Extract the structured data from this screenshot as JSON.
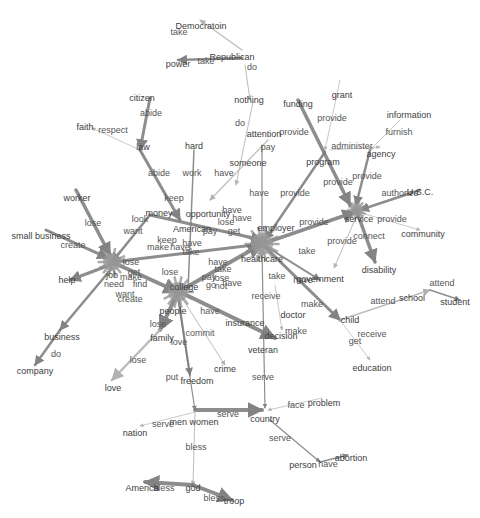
{
  "diagram": {
    "type": "semantic-network",
    "colors": {
      "edge": "#7a7a7a",
      "edge_light": "#b5b5b5",
      "hub": "#9a9a9a",
      "text": "#444444",
      "background": "#ffffff"
    },
    "hubs": [
      {
        "id": "hub-left",
        "x": 112,
        "y": 262,
        "r": 9
      },
      {
        "id": "hub-center",
        "x": 178,
        "y": 292,
        "r": 10
      },
      {
        "id": "hub-right",
        "x": 262,
        "y": 244,
        "r": 11
      },
      {
        "id": "hub-service",
        "x": 357,
        "y": 210,
        "r": 6
      }
    ],
    "edges": [
      {
        "x1": 242,
        "y1": 50,
        "x2": 200,
        "y2": 20,
        "w": 1.2,
        "c": "light"
      },
      {
        "x1": 242,
        "y1": 58,
        "x2": 178,
        "y2": 60,
        "w": 2.5,
        "c": "dark"
      },
      {
        "x1": 245,
        "y1": 65,
        "x2": 250,
        "y2": 100,
        "w": 1,
        "c": "light"
      },
      {
        "x1": 253,
        "y1": 102,
        "x2": 236,
        "y2": 185,
        "w": 1,
        "c": "light"
      },
      {
        "x1": 150,
        "y1": 98,
        "x2": 140,
        "y2": 150,
        "w": 3,
        "c": "dark"
      },
      {
        "x1": 140,
        "y1": 150,
        "x2": 92,
        "y2": 128,
        "w": 0.8,
        "c": "light"
      },
      {
        "x1": 140,
        "y1": 150,
        "x2": 180,
        "y2": 220,
        "w": 3,
        "c": "dark"
      },
      {
        "x1": 194,
        "y1": 150,
        "x2": 188,
        "y2": 290,
        "w": 1.5,
        "c": "dark"
      },
      {
        "x1": 268,
        "y1": 140,
        "x2": 210,
        "y2": 200,
        "w": 1.2,
        "c": "light"
      },
      {
        "x1": 262,
        "y1": 145,
        "x2": 262,
        "y2": 240,
        "w": 1.2,
        "c": "dark"
      },
      {
        "x1": 298,
        "y1": 100,
        "x2": 350,
        "y2": 205,
        "w": 3.5,
        "c": "dark"
      },
      {
        "x1": 340,
        "y1": 80,
        "x2": 325,
        "y2": 150,
        "w": 0.8,
        "c": "light"
      },
      {
        "x1": 325,
        "y1": 152,
        "x2": 265,
        "y2": 240,
        "w": 2.5,
        "c": "dark"
      },
      {
        "x1": 330,
        "y1": 150,
        "x2": 380,
        "y2": 147,
        "w": 0.8,
        "c": "light"
      },
      {
        "x1": 370,
        "y1": 150,
        "x2": 356,
        "y2": 205,
        "w": 2.5,
        "c": "dark"
      },
      {
        "x1": 400,
        "y1": 120,
        "x2": 370,
        "y2": 150,
        "w": 0.8,
        "c": "light"
      },
      {
        "x1": 420,
        "y1": 190,
        "x2": 360,
        "y2": 210,
        "w": 2.5,
        "c": "dark"
      },
      {
        "x1": 358,
        "y1": 212,
        "x2": 420,
        "y2": 230,
        "w": 0.8,
        "c": "light"
      },
      {
        "x1": 357,
        "y1": 212,
        "x2": 375,
        "y2": 262,
        "w": 3.5,
        "c": "dark"
      },
      {
        "x1": 262,
        "y1": 244,
        "x2": 355,
        "y2": 212,
        "w": 3.5,
        "c": "dark"
      },
      {
        "x1": 357,
        "y1": 215,
        "x2": 334,
        "y2": 268,
        "w": 1,
        "c": "light"
      },
      {
        "x1": 76,
        "y1": 190,
        "x2": 110,
        "y2": 255,
        "w": 3.5,
        "c": "dark"
      },
      {
        "x1": 46,
        "y1": 230,
        "x2": 108,
        "y2": 258,
        "w": 3,
        "c": "dark"
      },
      {
        "x1": 110,
        "y1": 265,
        "x2": 70,
        "y2": 280,
        "w": 3,
        "c": "dark"
      },
      {
        "x1": 112,
        "y1": 268,
        "x2": 60,
        "y2": 330,
        "w": 2.5,
        "c": "dark"
      },
      {
        "x1": 60,
        "y1": 330,
        "x2": 35,
        "y2": 365,
        "w": 2.5,
        "c": "dark"
      },
      {
        "x1": 112,
        "y1": 262,
        "x2": 178,
        "y2": 292,
        "w": 4,
        "c": "dark"
      },
      {
        "x1": 112,
        "y1": 262,
        "x2": 262,
        "y2": 244,
        "w": 3,
        "c": "dark"
      },
      {
        "x1": 178,
        "y1": 292,
        "x2": 262,
        "y2": 244,
        "w": 4,
        "c": "dark"
      },
      {
        "x1": 150,
        "y1": 215,
        "x2": 262,
        "y2": 240,
        "w": 3,
        "c": "dark"
      },
      {
        "x1": 150,
        "y1": 215,
        "x2": 112,
        "y2": 262,
        "w": 2.5,
        "c": "dark"
      },
      {
        "x1": 178,
        "y1": 292,
        "x2": 160,
        "y2": 330,
        "w": 4,
        "c": "dark"
      },
      {
        "x1": 160,
        "y1": 330,
        "x2": 112,
        "y2": 380,
        "w": 2.5,
        "c": "light"
      },
      {
        "x1": 178,
        "y1": 295,
        "x2": 190,
        "y2": 375,
        "w": 2,
        "c": "dark"
      },
      {
        "x1": 180,
        "y1": 295,
        "x2": 225,
        "y2": 365,
        "w": 1,
        "c": "light"
      },
      {
        "x1": 180,
        "y1": 292,
        "x2": 275,
        "y2": 338,
        "w": 4,
        "c": "dark"
      },
      {
        "x1": 262,
        "y1": 244,
        "x2": 340,
        "y2": 320,
        "w": 3,
        "c": "dark"
      },
      {
        "x1": 340,
        "y1": 320,
        "x2": 430,
        "y2": 290,
        "w": 1.5,
        "c": "light"
      },
      {
        "x1": 430,
        "y1": 290,
        "x2": 460,
        "y2": 300,
        "w": 1.5,
        "c": "dark"
      },
      {
        "x1": 340,
        "y1": 320,
        "x2": 370,
        "y2": 360,
        "w": 0.8,
        "c": "light"
      },
      {
        "x1": 262,
        "y1": 244,
        "x2": 320,
        "y2": 280,
        "w": 2,
        "c": "dark"
      },
      {
        "x1": 262,
        "y1": 250,
        "x2": 265,
        "y2": 408,
        "w": 1.2,
        "c": "dark"
      },
      {
        "x1": 275,
        "y1": 285,
        "x2": 282,
        "y2": 330,
        "w": 0.8,
        "c": "light"
      },
      {
        "x1": 178,
        "y1": 300,
        "x2": 195,
        "y2": 410,
        "w": 1.2,
        "c": "dark"
      },
      {
        "x1": 195,
        "y1": 410,
        "x2": 262,
        "y2": 410,
        "w": 4,
        "c": "dark"
      },
      {
        "x1": 195,
        "y1": 412,
        "x2": 140,
        "y2": 426,
        "w": 0.8,
        "c": "light"
      },
      {
        "x1": 322,
        "y1": 398,
        "x2": 268,
        "y2": 410,
        "w": 0.8,
        "c": "light"
      },
      {
        "x1": 195,
        "y1": 412,
        "x2": 193,
        "y2": 485,
        "w": 1,
        "c": "light"
      },
      {
        "x1": 193,
        "y1": 485,
        "x2": 145,
        "y2": 482,
        "w": 4,
        "c": "dark"
      },
      {
        "x1": 193,
        "y1": 485,
        "x2": 232,
        "y2": 500,
        "w": 4,
        "c": "dark"
      },
      {
        "x1": 270,
        "y1": 420,
        "x2": 320,
        "y2": 462,
        "w": 1.2,
        "c": "dark"
      },
      {
        "x1": 320,
        "y1": 462,
        "x2": 348,
        "y2": 455,
        "w": 1.5,
        "c": "dark"
      }
    ],
    "node_labels": [
      {
        "text": "Democratoin",
        "x": 201,
        "y": 26
      },
      {
        "text": "Republican",
        "x": 232,
        "y": 57
      },
      {
        "text": "power",
        "x": 178,
        "y": 64
      },
      {
        "text": "nothing",
        "x": 249,
        "y": 100
      },
      {
        "text": "citizen",
        "x": 142,
        "y": 98
      },
      {
        "text": "faith",
        "x": 85,
        "y": 127
      },
      {
        "text": "law",
        "x": 143,
        "y": 147
      },
      {
        "text": "hard",
        "x": 194,
        "y": 146
      },
      {
        "text": "attention",
        "x": 264,
        "y": 134
      },
      {
        "text": "someone",
        "x": 248,
        "y": 163
      },
      {
        "text": "funding",
        "x": 298,
        "y": 104
      },
      {
        "text": "grant",
        "x": 342,
        "y": 95
      },
      {
        "text": "program",
        "x": 323,
        "y": 162
      },
      {
        "text": "agency",
        "x": 381,
        "y": 154
      },
      {
        "text": "information",
        "x": 409,
        "y": 115
      },
      {
        "text": "U.S.C.",
        "x": 420,
        "y": 192
      },
      {
        "text": "service",
        "x": 359,
        "y": 219
      },
      {
        "text": "community",
        "x": 423,
        "y": 234
      },
      {
        "text": "disability",
        "x": 379,
        "y": 270
      },
      {
        "text": "worker",
        "x": 77,
        "y": 198
      },
      {
        "text": "small business",
        "x": 41,
        "y": 236
      },
      {
        "text": "help",
        "x": 67,
        "y": 280
      },
      {
        "text": "job",
        "x": 112,
        "y": 275
      },
      {
        "text": "money",
        "x": 159,
        "y": 213
      },
      {
        "text": "opportunity",
        "x": 208,
        "y": 214
      },
      {
        "text": "American",
        "x": 192,
        "y": 229
      },
      {
        "text": "employer",
        "x": 276,
        "y": 228
      },
      {
        "text": "healthcare",
        "x": 262,
        "y": 259
      },
      {
        "text": "government",
        "x": 320,
        "y": 279
      },
      {
        "text": "college",
        "x": 184,
        "y": 287
      },
      {
        "text": "people",
        "x": 173,
        "y": 311
      },
      {
        "text": "family",
        "x": 162,
        "y": 338
      },
      {
        "text": "insurance",
        "x": 245,
        "y": 323
      },
      {
        "text": "decision",
        "x": 281,
        "y": 336
      },
      {
        "text": "doctor",
        "x": 293,
        "y": 315
      },
      {
        "text": "child",
        "x": 350,
        "y": 320
      },
      {
        "text": "school",
        "x": 412,
        "y": 298
      },
      {
        "text": "student",
        "x": 455,
        "y": 302
      },
      {
        "text": "education",
        "x": 372,
        "y": 368
      },
      {
        "text": "business",
        "x": 62,
        "y": 337
      },
      {
        "text": "company",
        "x": 35,
        "y": 371
      },
      {
        "text": "love",
        "x": 113,
        "y": 388
      },
      {
        "text": "freedom",
        "x": 197,
        "y": 381
      },
      {
        "text": "crime",
        "x": 225,
        "y": 369
      },
      {
        "text": "veteran",
        "x": 263,
        "y": 350
      },
      {
        "text": "problem",
        "x": 324,
        "y": 403
      },
      {
        "text": "country",
        "x": 265,
        "y": 419
      },
      {
        "text": "men women",
        "x": 194,
        "y": 422
      },
      {
        "text": "nation",
        "x": 135,
        "y": 433
      },
      {
        "text": "person",
        "x": 303,
        "y": 465
      },
      {
        "text": "abortion",
        "x": 351,
        "y": 458
      },
      {
        "text": "America",
        "x": 142,
        "y": 488
      },
      {
        "text": "god",
        "x": 193,
        "y": 488
      },
      {
        "text": "troop",
        "x": 234,
        "y": 501
      }
    ],
    "edge_labels": [
      {
        "text": "take",
        "x": 179,
        "y": 32
      },
      {
        "text": "take",
        "x": 206,
        "y": 61
      },
      {
        "text": "do",
        "x": 252,
        "y": 67
      },
      {
        "text": "do",
        "x": 240,
        "y": 123
      },
      {
        "text": "abide",
        "x": 151,
        "y": 113
      },
      {
        "text": "respect",
        "x": 113,
        "y": 130
      },
      {
        "text": "abide",
        "x": 159,
        "y": 173
      },
      {
        "text": "work",
        "x": 192,
        "y": 173
      },
      {
        "text": "have",
        "x": 224,
        "y": 173
      },
      {
        "text": "pay",
        "x": 268,
        "y": 147
      },
      {
        "text": "have",
        "x": 259,
        "y": 193
      },
      {
        "text": "provide",
        "x": 295,
        "y": 193
      },
      {
        "text": "provide",
        "x": 294,
        "y": 132
      },
      {
        "text": "provide",
        "x": 332,
        "y": 118
      },
      {
        "text": "administer",
        "x": 352,
        "y": 146
      },
      {
        "text": "furnish",
        "x": 399,
        "y": 132
      },
      {
        "text": "provide",
        "x": 338,
        "y": 182
      },
      {
        "text": "provide",
        "x": 367,
        "y": 176
      },
      {
        "text": "authorize",
        "x": 400,
        "y": 193
      },
      {
        "text": "provide",
        "x": 392,
        "y": 219
      },
      {
        "text": "connect",
        "x": 369,
        "y": 236
      },
      {
        "text": "provide",
        "x": 314,
        "y": 222
      },
      {
        "text": "provide",
        "x": 342,
        "y": 241
      },
      {
        "text": "lose",
        "x": 93,
        "y": 223
      },
      {
        "text": "create",
        "x": 73,
        "y": 245
      },
      {
        "text": "look",
        "x": 140,
        "y": 219
      },
      {
        "text": "want",
        "x": 133,
        "y": 231
      },
      {
        "text": "keep",
        "x": 174,
        "y": 198
      },
      {
        "text": "keep",
        "x": 167,
        "y": 240
      },
      {
        "text": "make",
        "x": 158,
        "y": 247
      },
      {
        "text": "have",
        "x": 192,
        "y": 243
      },
      {
        "text": "have",
        "x": 180,
        "y": 247
      },
      {
        "text": "take",
        "x": 191,
        "y": 252
      },
      {
        "text": "have",
        "x": 232,
        "y": 210
      },
      {
        "text": "lose",
        "x": 226,
        "y": 222
      },
      {
        "text": "have",
        "x": 242,
        "y": 218
      },
      {
        "text": "pay",
        "x": 210,
        "y": 231
      },
      {
        "text": "get",
        "x": 234,
        "y": 231
      },
      {
        "text": "lose",
        "x": 131,
        "y": 262
      },
      {
        "text": "get",
        "x": 134,
        "y": 272
      },
      {
        "text": "make",
        "x": 131,
        "y": 277
      },
      {
        "text": "need",
        "x": 114,
        "y": 284
      },
      {
        "text": "find",
        "x": 140,
        "y": 284
      },
      {
        "text": "want",
        "x": 125,
        "y": 294
      },
      {
        "text": "create",
        "x": 130,
        "y": 299
      },
      {
        "text": "lose",
        "x": 170,
        "y": 272
      },
      {
        "text": "have",
        "x": 218,
        "y": 262
      },
      {
        "text": "take",
        "x": 223,
        "y": 269
      },
      {
        "text": "pay",
        "x": 209,
        "y": 277
      },
      {
        "text": "lose",
        "x": 221,
        "y": 278
      },
      {
        "text": "go",
        "x": 211,
        "y": 285
      },
      {
        "text": "not",
        "x": 221,
        "y": 286
      },
      {
        "text": "have",
        "x": 232,
        "y": 283
      },
      {
        "text": "take",
        "x": 307,
        "y": 251
      },
      {
        "text": "take",
        "x": 277,
        "y": 276
      },
      {
        "text": "have",
        "x": 303,
        "y": 280
      },
      {
        "text": "receive",
        "x": 266,
        "y": 296
      },
      {
        "text": "make",
        "x": 312,
        "y": 304
      },
      {
        "text": "make",
        "x": 296,
        "y": 331
      },
      {
        "text": "have",
        "x": 210,
        "y": 311
      },
      {
        "text": "lose",
        "x": 158,
        "y": 324
      },
      {
        "text": "love",
        "x": 179,
        "y": 342
      },
      {
        "text": "commit",
        "x": 200,
        "y": 333
      },
      {
        "text": "lose",
        "x": 138,
        "y": 360
      },
      {
        "text": "put",
        "x": 172,
        "y": 377
      },
      {
        "text": "attend",
        "x": 383,
        "y": 301
      },
      {
        "text": "attend",
        "x": 442,
        "y": 283
      },
      {
        "text": "receive",
        "x": 372,
        "y": 334
      },
      {
        "text": "get",
        "x": 355,
        "y": 341
      },
      {
        "text": "do",
        "x": 56,
        "y": 354
      },
      {
        "text": "serve",
        "x": 263,
        "y": 377
      },
      {
        "text": "serve",
        "x": 228,
        "y": 414
      },
      {
        "text": "face",
        "x": 296,
        "y": 405
      },
      {
        "text": "serve",
        "x": 163,
        "y": 424
      },
      {
        "text": "serve",
        "x": 280,
        "y": 438
      },
      {
        "text": "bless",
        "x": 196,
        "y": 447
      },
      {
        "text": "bless",
        "x": 164,
        "y": 488
      },
      {
        "text": "bless",
        "x": 214,
        "y": 498
      },
      {
        "text": "have",
        "x": 328,
        "y": 464
      }
    ]
  }
}
